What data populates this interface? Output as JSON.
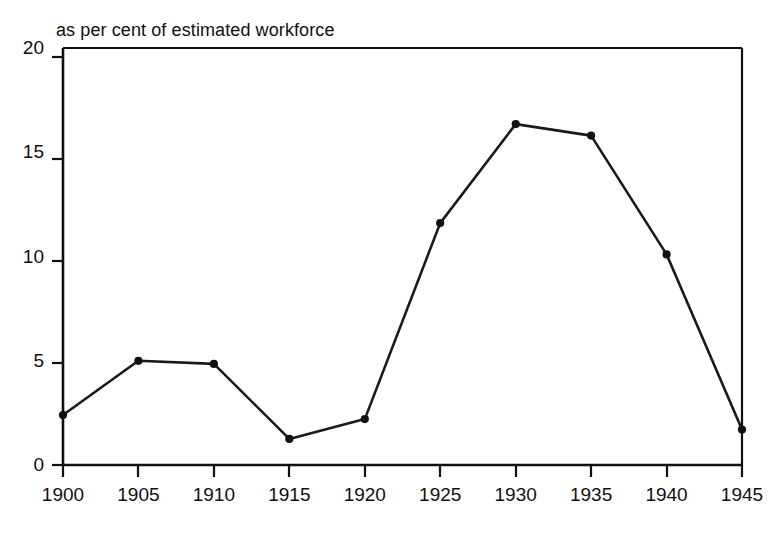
{
  "chart_data": {
    "type": "line",
    "title": "as per cent of estimated workforce",
    "subtitle": "",
    "xlabel": "",
    "ylabel": "",
    "x": [
      1900,
      1905,
      1910,
      1915,
      1920,
      1925,
      1930,
      1935,
      1940,
      1945
    ],
    "values": [
      2.4,
      5.0,
      4.85,
      1.25,
      2.2,
      11.6,
      16.35,
      15.8,
      10.1,
      1.7
    ],
    "series": [
      {
        "name": "unemployment",
        "values": [
          2.4,
          5.0,
          4.85,
          1.25,
          2.2,
          11.6,
          16.35,
          15.8,
          10.1,
          1.7
        ]
      }
    ],
    "xtick_labels": [
      "1900",
      "1905",
      "1910",
      "1915",
      "1920",
      "1925",
      "1930",
      "1935",
      "1940",
      "1945"
    ],
    "ytick_labels": [
      "0",
      "5",
      "10",
      "15",
      "20"
    ],
    "ytick_values": [
      0,
      5,
      10,
      15,
      20
    ],
    "xlim": [
      1900,
      1945
    ],
    "ylim": [
      0,
      20
    ],
    "grid": false,
    "legend": false,
    "legend_position": "none",
    "marker": "filled-circle",
    "line_color": "#1a1a1a",
    "marker_color": "#111111",
    "axis_color": "#111111",
    "background_color": "#ffffff",
    "annotations": []
  }
}
